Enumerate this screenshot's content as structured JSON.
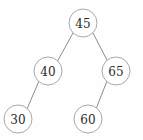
{
  "diagram": {
    "background_color": "#fefefe",
    "node_stroke_color": "#a8a8a8",
    "node_fill_color": "#ffffff",
    "edge_color": "#8c8c8c",
    "label_color": "#2a2a2a",
    "node_radius": 14,
    "nodes": [
      {
        "id": "root",
        "label": "45",
        "cx": 83,
        "cy": 23,
        "level": 0,
        "role": "root"
      },
      {
        "id": "n40",
        "label": "40",
        "cx": 48,
        "cy": 71,
        "level": 1,
        "role": "left-child"
      },
      {
        "id": "n65",
        "label": "65",
        "cx": 116,
        "cy": 71,
        "level": 1,
        "role": "right-child"
      },
      {
        "id": "n30",
        "label": "30",
        "cx": 18,
        "cy": 119,
        "level": 2,
        "role": "left-child"
      },
      {
        "id": "n60",
        "label": "60",
        "cx": 88,
        "cy": 119,
        "level": 2,
        "role": "left-child"
      }
    ],
    "edges": [
      {
        "id": "e-root-40",
        "from": "root",
        "to": "n40",
        "x1": 73,
        "y1": 33,
        "x2": 57,
        "y2": 62
      },
      {
        "id": "e-root-65",
        "from": "root",
        "to": "n65",
        "x1": 93,
        "y1": 33,
        "x2": 108,
        "y2": 62
      },
      {
        "id": "e-40-30",
        "from": "n40",
        "to": "n30",
        "x1": 39,
        "y1": 81,
        "x2": 27,
        "y2": 109
      },
      {
        "id": "e-65-60",
        "from": "n65",
        "to": "n60",
        "x1": 107,
        "y1": 81,
        "x2": 96,
        "y2": 109
      }
    ]
  }
}
